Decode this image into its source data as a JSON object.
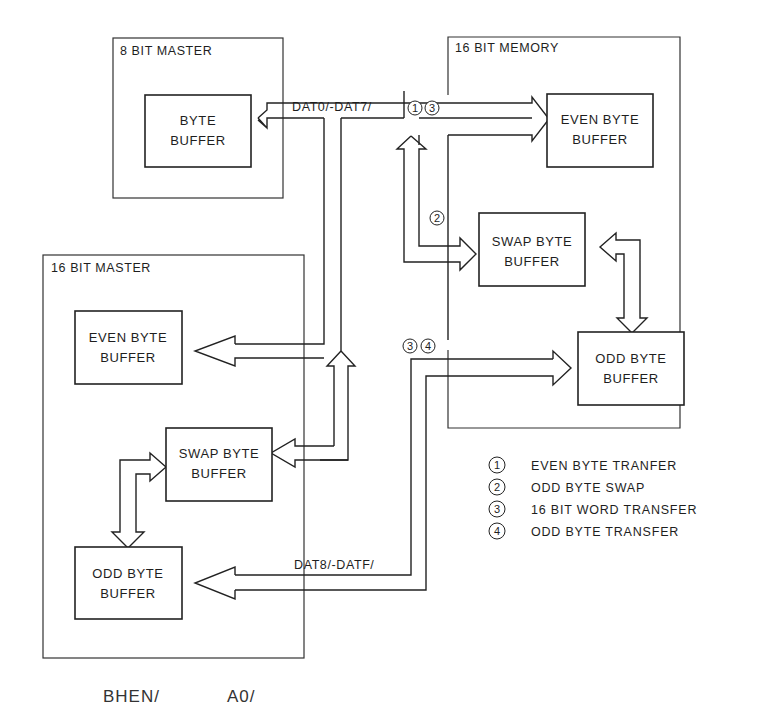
{
  "diagram": {
    "containers": {
      "master8": {
        "title": "8 BIT MASTER"
      },
      "memory16": {
        "title": "16 BIT MEMORY"
      },
      "master16": {
        "title": "16 BIT MASTER"
      }
    },
    "blocks": {
      "m8_byte": {
        "line1": "BYTE",
        "line2": "BUFFER"
      },
      "mem_even": {
        "line1": "EVEN BYTE",
        "line2": "BUFFER"
      },
      "mem_swap": {
        "line1": "SWAP BYTE",
        "line2": "BUFFER"
      },
      "mem_odd": {
        "line1": "ODD BYTE",
        "line2": "BUFFER"
      },
      "m16_even": {
        "line1": "EVEN BYTE",
        "line2": "BUFFER"
      },
      "m16_swap": {
        "line1": "SWAP BYTE",
        "line2": "BUFFER"
      },
      "m16_odd": {
        "line1": "ODD BYTE",
        "line2": "BUFFER"
      }
    },
    "buses": {
      "low": {
        "label": "DAT0/-DAT7/",
        "markers": [
          "1",
          "3"
        ]
      },
      "high": {
        "label": "DAT8/-DATF/",
        "markers": [
          "3",
          "4"
        ]
      },
      "swap_marker": "2"
    },
    "legend": [
      {
        "num": "1",
        "text": "EVEN BYTE TRANFER"
      },
      {
        "num": "2",
        "text": "ODD BYTE SWAP"
      },
      {
        "num": "3",
        "text": "16 BIT WORD TRANSFER"
      },
      {
        "num": "4",
        "text": "ODD BYTE TRANSFER"
      }
    ],
    "signals": {
      "bhen": "BHEN/",
      "a0": "A0/"
    }
  }
}
